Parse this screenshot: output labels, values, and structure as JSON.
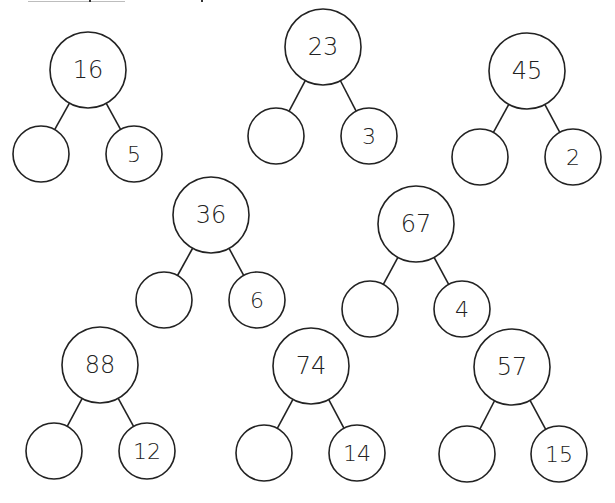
{
  "worksheet": {
    "stroke_color": "#222222",
    "background": "#ffffff",
    "number_bonds": [
      {
        "id": "bond-1",
        "whole": "16",
        "part_a": "",
        "part_b": "5",
        "whole_center": [
          88,
          70
        ],
        "part_a_center": [
          41,
          154
        ],
        "part_b_center": [
          134,
          154
        ]
      },
      {
        "id": "bond-2",
        "whole": "23",
        "part_a": "",
        "part_b": "3",
        "whole_center": [
          323,
          47
        ],
        "part_a_center": [
          276,
          136
        ],
        "part_b_center": [
          369,
          136
        ]
      },
      {
        "id": "bond-3",
        "whole": "45",
        "part_a": "",
        "part_b": "2",
        "whole_center": [
          527,
          71
        ],
        "part_a_center": [
          480,
          157
        ],
        "part_b_center": [
          573,
          157
        ]
      },
      {
        "id": "bond-4",
        "whole": "36",
        "part_a": "",
        "part_b": "6",
        "whole_center": [
          211,
          215
        ],
        "part_a_center": [
          164,
          300
        ],
        "part_b_center": [
          257,
          300
        ]
      },
      {
        "id": "bond-5",
        "whole": "67",
        "part_a": "",
        "part_b": "4",
        "whole_center": [
          416,
          224
        ],
        "part_a_center": [
          370,
          309
        ],
        "part_b_center": [
          462,
          309
        ]
      },
      {
        "id": "bond-6",
        "whole": "88",
        "part_a": "",
        "part_b": "12",
        "whole_center": [
          100,
          365
        ],
        "part_a_center": [
          54,
          451
        ],
        "part_b_center": [
          147,
          451
        ]
      },
      {
        "id": "bond-7",
        "whole": "74",
        "part_a": "",
        "part_b": "14",
        "whole_center": [
          311,
          366
        ],
        "part_a_center": [
          264,
          453
        ],
        "part_b_center": [
          357,
          453
        ]
      },
      {
        "id": "bond-8",
        "whole": "57",
        "part_a": "",
        "part_b": "15",
        "whole_center": [
          512,
          367
        ],
        "part_a_center": [
          467,
          454
        ],
        "part_b_center": [
          559,
          454
        ]
      }
    ],
    "whole_radius": 38,
    "part_radius": 28
  }
}
